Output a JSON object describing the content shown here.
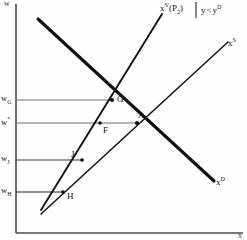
{
  "figure": {
    "type": "economics-supply-demand-diagram",
    "axes": {
      "y_axis_label": "w",
      "x_axis_label": "x",
      "y_axis_name": "wage-axis",
      "x_axis_name": "quantity-axis"
    },
    "y_ticks": [
      {
        "id": "wG",
        "label_main": "w",
        "label_sub": "G",
        "y": 100
      },
      {
        "id": "wstar",
        "label_main": "w",
        "label_sub": "*",
        "y": 123
      },
      {
        "id": "wJ",
        "label_main": "w",
        "label_sub": "J",
        "y": 160
      },
      {
        "id": "wH",
        "label_main": "w",
        "label_sub": "H",
        "y": 192
      }
    ],
    "curves": [
      {
        "id": "supply-shifted",
        "label_main": "x",
        "label_sup": "S'",
        "label_paren": "(P",
        "label_sub": "2",
        "label_close": ")"
      },
      {
        "id": "supply",
        "label_main": "x",
        "label_sup": "S"
      },
      {
        "id": "demand",
        "label_main": "x",
        "label_sup": "D"
      }
    ],
    "condition": {
      "text_left": "y",
      "operator": "<",
      "text_right": "y",
      "text_right_sup": "D"
    },
    "points": [
      {
        "id": "G",
        "label": "G",
        "x": 112,
        "y": 100
      },
      {
        "id": "A",
        "label": "A",
        "x": 137,
        "y": 123
      },
      {
        "id": "F",
        "label": "F",
        "x": 100,
        "y": 123
      },
      {
        "id": "J",
        "label": "J",
        "x": 82,
        "y": 160
      },
      {
        "id": "H",
        "label": "H",
        "x": 63,
        "y": 192
      }
    ],
    "colors": {
      "curve": "#111111",
      "axis": "#4a4a4a",
      "guide": "#6e6e6e",
      "text": "#111111",
      "background": "#fefefe"
    }
  }
}
